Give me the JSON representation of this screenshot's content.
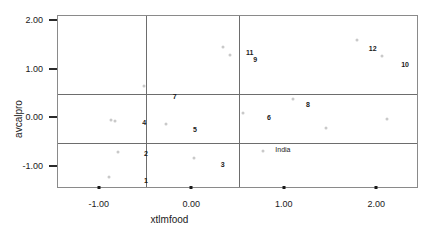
{
  "chart_data": {
    "type": "scatter",
    "title": "",
    "xlabel": "xtlmfood",
    "ylabel": "avcalpro",
    "xlim": [
      -1.45,
      2.45
    ],
    "ylim": [
      -1.45,
      2.1
    ],
    "xticks": [
      "-1.00",
      "0.00",
      "1.00",
      "2.00"
    ],
    "xtick_values": [
      -1.0,
      0.0,
      1.0,
      2.0
    ],
    "yticks": [
      "2.00",
      "1.00",
      "0.00",
      "-1.00"
    ],
    "ytick_values": [
      2.0,
      1.0,
      0.0,
      -1.0
    ],
    "grid": false,
    "legend": "none",
    "reference_lines": {
      "horizontal": [
        0.5,
        -0.5
      ],
      "vertical": [
        -0.5,
        0.5
      ]
    },
    "marker_color": "#c9c9c9",
    "label_color": "#1a1a1a",
    "points": [
      {
        "x": -0.88,
        "y": -0.03,
        "label": ""
      },
      {
        "x": -0.83,
        "y": -0.05,
        "label": ""
      },
      {
        "x": -0.8,
        "y": -0.7,
        "label": ""
      },
      {
        "x": -0.9,
        "y": -1.2,
        "label": ""
      },
      {
        "x": -0.52,
        "y": 0.66,
        "label": ""
      },
      {
        "x": -0.28,
        "y": -0.12,
        "label": ""
      },
      {
        "x": 0.02,
        "y": -0.82,
        "label": ""
      },
      {
        "x": 0.33,
        "y": 1.46,
        "label": ""
      },
      {
        "x": 0.41,
        "y": 1.3,
        "label": ""
      },
      {
        "x": 0.55,
        "y": 0.11,
        "label": ""
      },
      {
        "x": 0.76,
        "y": -0.68,
        "label": ""
      },
      {
        "x": 1.09,
        "y": 0.39,
        "label": ""
      },
      {
        "x": 1.44,
        "y": -0.2,
        "label": ""
      },
      {
        "x": 1.78,
        "y": 1.6,
        "label": ""
      },
      {
        "x": 2.05,
        "y": 1.28,
        "label": ""
      },
      {
        "x": 2.1,
        "y": -0.02,
        "label": ""
      }
    ],
    "annotations": [
      {
        "text": "1",
        "x": -0.5,
        "y": -1.27
      },
      {
        "text": "2",
        "x": -0.5,
        "y": -0.72
      },
      {
        "text": "3",
        "x": 0.33,
        "y": -0.93
      },
      {
        "text": "4",
        "x": -0.52,
        "y": -0.08
      },
      {
        "text": "5",
        "x": 0.03,
        "y": -0.22
      },
      {
        "text": "6",
        "x": 0.83,
        "y": 0.02
      },
      {
        "text": "7",
        "x": -0.19,
        "y": 0.46
      },
      {
        "text": "8",
        "x": 1.25,
        "y": 0.3
      },
      {
        "text": "9",
        "x": 0.68,
        "y": 1.22
      },
      {
        "text": "10",
        "x": 2.3,
        "y": 1.12
      },
      {
        "text": "11",
        "x": 0.62,
        "y": 1.36
      },
      {
        "text": "12",
        "x": 1.95,
        "y": 1.44
      },
      {
        "text": "India",
        "x": 0.98,
        "y": -0.62
      }
    ]
  }
}
